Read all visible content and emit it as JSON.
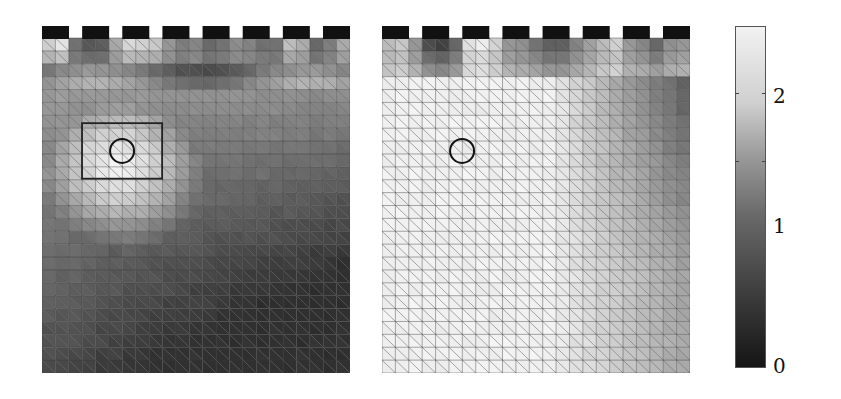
{
  "chart_data": {
    "type": "heatmap",
    "title": "",
    "colorbar": {
      "min": 0,
      "max": 2.4,
      "ticks": [
        0,
        1,
        2
      ],
      "tick_labels": [
        "0",
        "1",
        "2"
      ],
      "colormap": "gray"
    },
    "mesh": {
      "columns": 23,
      "rows": 26,
      "element": "triangular (each square split by a diagonal)"
    },
    "electrodes": {
      "count": 8,
      "position": "top edge",
      "color": "#111111"
    },
    "panels": [
      {
        "name": "left",
        "annotations": [
          {
            "type": "rectangle",
            "x_frac": [
              0.13,
              0.39
            ],
            "y_frac": [
              0.28,
              0.44
            ]
          },
          {
            "type": "circle",
            "cx_frac": 0.26,
            "cy_frac": 0.36,
            "r_frac": 0.04
          }
        ],
        "value_field": {
          "top_row_range": [
            0.6,
            2.2
          ],
          "bright_region_center_frac": [
            0.25,
            0.4
          ],
          "bright_region_value": 2.3,
          "bottom_right_value": 0.4,
          "bottom_left_value": 0.6
        }
      },
      {
        "name": "right",
        "annotations": [
          {
            "type": "circle",
            "cx_frac": 0.26,
            "cy_frac": 0.36,
            "r_frac": 0.04
          }
        ],
        "value_field": {
          "top_row_range": [
            0.4,
            2.3
          ],
          "left_region_value": 2.3,
          "right_edge_value": 0.8,
          "top_right_value": 0.6
        }
      }
    ]
  },
  "labels": {
    "tick_0": "0",
    "tick_1": "1",
    "tick_2": "2"
  }
}
